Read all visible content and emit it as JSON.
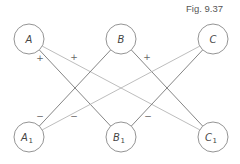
{
  "figure": {
    "label": "Fig. 9.37"
  },
  "diagram": {
    "node_radius": 15,
    "colors": {
      "stroke": "#888888",
      "edge_dark": "#777777",
      "edge_light": "#b5b5b5",
      "text": "#444444"
    },
    "nodes": [
      {
        "id": "A",
        "label": "A",
        "sub": "",
        "x": 29,
        "y": 39
      },
      {
        "id": "B",
        "label": "B",
        "sub": "",
        "x": 121,
        "y": 39
      },
      {
        "id": "C",
        "label": "C",
        "sub": "",
        "x": 213,
        "y": 39
      },
      {
        "id": "A1",
        "label": "A",
        "sub": "1",
        "x": 29,
        "y": 137
      },
      {
        "id": "B1",
        "label": "B",
        "sub": "1",
        "x": 121,
        "y": 137
      },
      {
        "id": "C1",
        "label": "C",
        "sub": "1",
        "x": 213,
        "y": 137
      }
    ],
    "edges": [
      {
        "from": "A",
        "to": "B1",
        "sign": "+",
        "shade": "dark"
      },
      {
        "from": "A",
        "to": "C1",
        "sign": "+",
        "shade": "light"
      },
      {
        "from": "B",
        "to": "A1",
        "sign": "",
        "shade": "dark"
      },
      {
        "from": "B",
        "to": "C1",
        "sign": "+",
        "shade": "dark"
      },
      {
        "from": "C",
        "to": "A1",
        "sign": "−",
        "shade": "light"
      },
      {
        "from": "C",
        "to": "B1",
        "sign": "−",
        "shade": "dark"
      }
    ],
    "sign_labels": [
      {
        "text": "+",
        "x": 40,
        "y": 61
      },
      {
        "text": "+",
        "x": 74,
        "y": 60
      },
      {
        "text": "+",
        "x": 147,
        "y": 60
      },
      {
        "text": "−",
        "x": 40,
        "y": 119
      },
      {
        "text": "−",
        "x": 74,
        "y": 119
      },
      {
        "text": "−",
        "x": 148,
        "y": 119
      }
    ]
  }
}
